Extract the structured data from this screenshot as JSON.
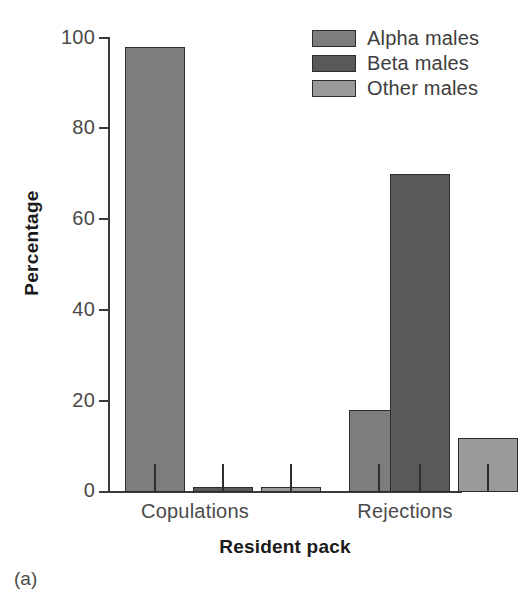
{
  "figure": {
    "caption": "(a)"
  },
  "chart_data": {
    "type": "bar",
    "title": "",
    "xlabel": "Resident pack",
    "ylabel": "Percentage",
    "categories": [
      "Copulations",
      "Rejections"
    ],
    "ylim": [
      0,
      100
    ],
    "yticks": [
      0,
      20,
      40,
      60,
      80,
      100
    ],
    "ytick_labels": [
      "0",
      "20",
      "40",
      "60",
      "80",
      "100"
    ],
    "grid": false,
    "legend_position": "top-right",
    "series": [
      {
        "name": "Alpha males",
        "color": "#7d7d7d",
        "values": [
          98,
          18
        ]
      },
      {
        "name": "Beta males",
        "color": "#595959",
        "values": [
          1,
          70
        ]
      },
      {
        "name": "Other males",
        "color": "#9a9a9a",
        "values": [
          1,
          12
        ]
      }
    ]
  },
  "legend": {
    "items": [
      {
        "label": "Alpha males",
        "color": "#7d7d7d"
      },
      {
        "label": "Beta males",
        "color": "#595959"
      },
      {
        "label": "Other males",
        "color": "#9a9a9a"
      }
    ]
  },
  "axis": {
    "y_title": "Percentage",
    "x_title": "Resident pack",
    "y_tick_labels": [
      "100",
      "80",
      "60",
      "40",
      "20",
      "0"
    ],
    "x_category_labels": [
      "Copulations",
      "Rejections"
    ]
  }
}
